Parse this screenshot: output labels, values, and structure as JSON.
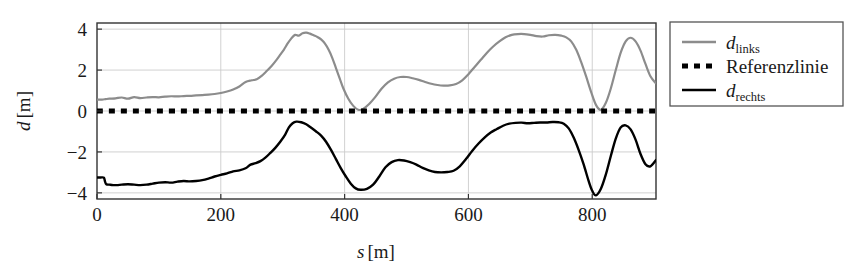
{
  "chart_data": {
    "type": "line",
    "title": "",
    "subtitle": "",
    "xlabel": "s [m]",
    "xlabel_symbol": "s",
    "xlabel_unit": "[m]",
    "ylabel": "d [m]",
    "ylabel_symbol": "d",
    "ylabel_unit": "[m]",
    "xlim": [
      0,
      903
    ],
    "ylim": [
      -4.3,
      4.3
    ],
    "xticks": [
      0,
      200,
      400,
      600,
      800
    ],
    "xticklabels": [
      "0",
      "200",
      "400",
      "600",
      "800"
    ],
    "yticks": [
      -4,
      -2,
      0,
      2,
      4
    ],
    "yticklabels": [
      "-4",
      "-2",
      "0",
      "2",
      "4"
    ],
    "grid": true,
    "grid_color": "#cccccc",
    "frame_color": "#333333",
    "legend_position": "right-outside",
    "series": [
      {
        "name": "d_links",
        "label_symbol": "d",
        "label_sub": "links",
        "color": "#8c8c8c",
        "style": "solid",
        "width": 2.2,
        "x": [
          0,
          8,
          14,
          20,
          30,
          40,
          50,
          60,
          70,
          80,
          90,
          100,
          110,
          120,
          130,
          140,
          150,
          160,
          170,
          180,
          190,
          200,
          210,
          220,
          230,
          240,
          250,
          258,
          266,
          274,
          282,
          290,
          296,
          302,
          308,
          314,
          320,
          326,
          332,
          338,
          344,
          350,
          356,
          362,
          368,
          374,
          380,
          386,
          392,
          398,
          406,
          414,
          422,
          430,
          440,
          450,
          460,
          470,
          480,
          490,
          500,
          510,
          520,
          530,
          540,
          550,
          560,
          570,
          580,
          590,
          600,
          610,
          620,
          630,
          640,
          650,
          660,
          670,
          680,
          690,
          700,
          710,
          720,
          730,
          740,
          750,
          758,
          766,
          774,
          782,
          790,
          798,
          806,
          814,
          822,
          830,
          838,
          846,
          854,
          862,
          870,
          878,
          886,
          894,
          903
        ],
        "y": [
          0.55,
          0.56,
          0.58,
          0.6,
          0.62,
          0.66,
          0.6,
          0.68,
          0.63,
          0.66,
          0.68,
          0.67,
          0.7,
          0.72,
          0.71,
          0.73,
          0.74,
          0.76,
          0.78,
          0.8,
          0.83,
          0.88,
          0.95,
          1.05,
          1.2,
          1.42,
          1.5,
          1.55,
          1.72,
          1.95,
          2.2,
          2.5,
          2.75,
          3.0,
          3.3,
          3.55,
          3.72,
          3.68,
          3.8,
          3.83,
          3.78,
          3.7,
          3.62,
          3.5,
          3.3,
          3.0,
          2.6,
          2.1,
          1.6,
          1.1,
          0.6,
          0.25,
          0.06,
          0.1,
          0.35,
          0.7,
          1.1,
          1.4,
          1.58,
          1.66,
          1.66,
          1.6,
          1.52,
          1.42,
          1.33,
          1.27,
          1.24,
          1.25,
          1.32,
          1.5,
          1.8,
          2.15,
          2.5,
          2.85,
          3.15,
          3.4,
          3.6,
          3.72,
          3.76,
          3.76,
          3.72,
          3.66,
          3.64,
          3.7,
          3.72,
          3.68,
          3.6,
          3.4,
          3.0,
          2.4,
          1.7,
          0.95,
          0.3,
          0.06,
          0.4,
          1.1,
          2.0,
          2.85,
          3.4,
          3.58,
          3.4,
          2.95,
          2.3,
          1.7,
          1.35
        ]
      },
      {
        "name": "Referenzlinie",
        "label_symbol": "Referenzlinie",
        "label_sub": "",
        "color": "#000000",
        "style": "dotted",
        "width": 5.0,
        "x": [
          0,
          903
        ],
        "y": [
          0,
          0
        ]
      },
      {
        "name": "d_rechts",
        "label_symbol": "d",
        "label_sub": "rechts",
        "color": "#000000",
        "style": "solid",
        "width": 2.4,
        "x": [
          0,
          6,
          11,
          13,
          15,
          20,
          26,
          32,
          40,
          50,
          60,
          70,
          80,
          90,
          100,
          110,
          120,
          130,
          140,
          150,
          160,
          170,
          180,
          190,
          200,
          210,
          220,
          230,
          240,
          248,
          256,
          264,
          272,
          280,
          288,
          296,
          304,
          310,
          316,
          322,
          330,
          338,
          346,
          354,
          362,
          370,
          378,
          386,
          394,
          402,
          410,
          418,
          426,
          436,
          446,
          456,
          466,
          476,
          486,
          496,
          506,
          516,
          526,
          536,
          546,
          556,
          566,
          576,
          586,
          596,
          606,
          616,
          626,
          636,
          646,
          656,
          666,
          676,
          686,
          696,
          706,
          716,
          726,
          736,
          746,
          754,
          762,
          770,
          778,
          786,
          794,
          800,
          806,
          814,
          822,
          830,
          838,
          846,
          854,
          862,
          870,
          878,
          886,
          894,
          903
        ],
        "y": [
          -3.25,
          -3.25,
          -3.26,
          -3.45,
          -3.58,
          -3.6,
          -3.62,
          -3.62,
          -3.6,
          -3.58,
          -3.6,
          -3.62,
          -3.6,
          -3.55,
          -3.5,
          -3.48,
          -3.5,
          -3.45,
          -3.42,
          -3.44,
          -3.42,
          -3.38,
          -3.3,
          -3.2,
          -3.12,
          -3.05,
          -2.95,
          -2.9,
          -2.8,
          -2.62,
          -2.55,
          -2.45,
          -2.28,
          -2.05,
          -1.8,
          -1.5,
          -1.15,
          -0.8,
          -0.6,
          -0.52,
          -0.55,
          -0.65,
          -0.82,
          -1.0,
          -1.2,
          -1.5,
          -1.9,
          -2.35,
          -2.8,
          -3.2,
          -3.55,
          -3.78,
          -3.85,
          -3.8,
          -3.6,
          -3.2,
          -2.75,
          -2.5,
          -2.4,
          -2.42,
          -2.5,
          -2.62,
          -2.78,
          -2.9,
          -2.98,
          -3.0,
          -2.98,
          -2.92,
          -2.7,
          -2.35,
          -1.95,
          -1.6,
          -1.3,
          -1.05,
          -0.88,
          -0.72,
          -0.62,
          -0.58,
          -0.57,
          -0.6,
          -0.58,
          -0.56,
          -0.56,
          -0.54,
          -0.55,
          -0.62,
          -0.85,
          -1.3,
          -1.9,
          -2.6,
          -3.4,
          -3.9,
          -4.12,
          -3.8,
          -3.1,
          -2.2,
          -1.35,
          -0.8,
          -0.7,
          -0.9,
          -1.4,
          -2.1,
          -2.6,
          -2.7,
          -2.4
        ]
      }
    ]
  },
  "legend": {
    "entries": [
      {
        "key": "d-links",
        "symbol": "d",
        "sub": "links",
        "text": "",
        "swatch": "solid-gray"
      },
      {
        "key": "referenzlinie",
        "symbol": "",
        "sub": "",
        "text": "Referenzlinie",
        "swatch": "dotted-black"
      },
      {
        "key": "d-rechts",
        "symbol": "d",
        "sub": "rechts",
        "text": "",
        "swatch": "solid-black"
      }
    ]
  }
}
